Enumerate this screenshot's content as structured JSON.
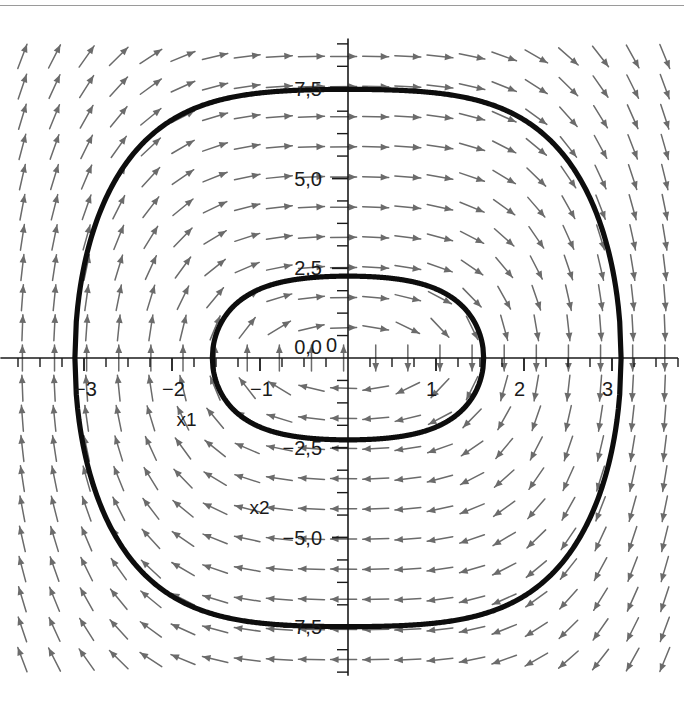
{
  "figure": {
    "kind": "phase-portrait",
    "background_color": "#ffffff",
    "top_rule_color": "#9a9a9a",
    "width": 684,
    "height": 713
  },
  "chart_data": {
    "type": "scatter",
    "title": "",
    "subtitle": "",
    "xlabel": "x1",
    "ylabel": "x2",
    "grid": false,
    "legend": null,
    "xlim": [
      -3.95,
      3.75
    ],
    "ylim": [
      -8.85,
      8.9
    ],
    "xticks": [
      -3,
      -2,
      -1,
      0,
      1,
      2,
      3
    ],
    "xticklabels": [
      "−3",
      "−2",
      "−1",
      "0",
      "1",
      "2",
      "3"
    ],
    "yticks": [
      -7.5,
      -5.0,
      -2.5,
      0.0,
      2.5,
      5.0,
      7.5
    ],
    "yticklabels": [
      "−7,5",
      "−5,0",
      "−2,5",
      "0,0",
      "2,5",
      "5,0",
      "7,5"
    ],
    "minor_tick_step_x": 0.25,
    "minor_tick_step_y": 0.625,
    "axis_position": "zero-crossing",
    "annotations": [
      {
        "text": "x1",
        "x": -1.95,
        "y": -1.9
      },
      {
        "text": "x2",
        "x": -1.12,
        "y": -4.35
      }
    ],
    "vector_field": {
      "name": "direction-field",
      "color": "#6b6b6b",
      "arrow_style": "single-headed",
      "grid_columns": 21,
      "grid_rows": 21,
      "system": {
        "dx1_dt": "x2",
        "dx2_dt": "-x1 - x1^3"
      },
      "x_range": [
        -3.7,
        3.6
      ],
      "y_range": [
        -8.4,
        8.4
      ]
    },
    "series": [
      {
        "name": "inner-orbit",
        "style": "closed-trajectory",
        "color": "#0d0d0d",
        "linewidth": 5.2,
        "energy_level": 2.6,
        "x_extent": [
          -0.88,
          0.88
        ],
        "y_extent": [
          -2.15,
          2.3
        ],
        "description": "small closed orbit around the origin"
      },
      {
        "name": "outer-orbit",
        "style": "closed-trajectory",
        "color": "#0d0d0d",
        "linewidth": 5.2,
        "energy_level": 28.0,
        "x_extent": [
          -3.12,
          3.12
        ],
        "y_extent": [
          -6.25,
          6.5
        ],
        "description": "large rounded-diamond closed orbit"
      }
    ]
  }
}
